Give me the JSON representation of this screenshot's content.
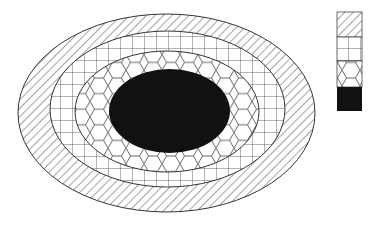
{
  "diagram": {
    "type": "concentric-ellipses",
    "colors": {
      "stroke": "#333333",
      "fill_core": "#111111",
      "background": "#ffffff"
    },
    "layers": [
      {
        "name": "outer-layer",
        "pattern": "diagonal-stripes",
        "cx": 166.5,
        "cy": 113,
        "rx": 148.5,
        "ry": 99
      },
      {
        "name": "second-layer",
        "pattern": "square-grid",
        "cx": 167.5,
        "cy": 109,
        "rx": 117.5,
        "ry": 78
      },
      {
        "name": "third-layer",
        "pattern": "hexagonal-cells",
        "cx": 167,
        "cy": 111.5,
        "rx": 92,
        "ry": 60.5
      },
      {
        "name": "core",
        "pattern": "solid-black",
        "cx": 169.5,
        "cy": 111,
        "rx": 60.5,
        "ry": 42
      }
    ],
    "legend": {
      "x": 337,
      "y": 12,
      "width": 25,
      "cell_height": 25,
      "items": [
        {
          "pattern": "diagonal-stripes"
        },
        {
          "pattern": "square-grid"
        },
        {
          "pattern": "hexagonal-cells"
        },
        {
          "pattern": "solid-black"
        }
      ]
    }
  }
}
